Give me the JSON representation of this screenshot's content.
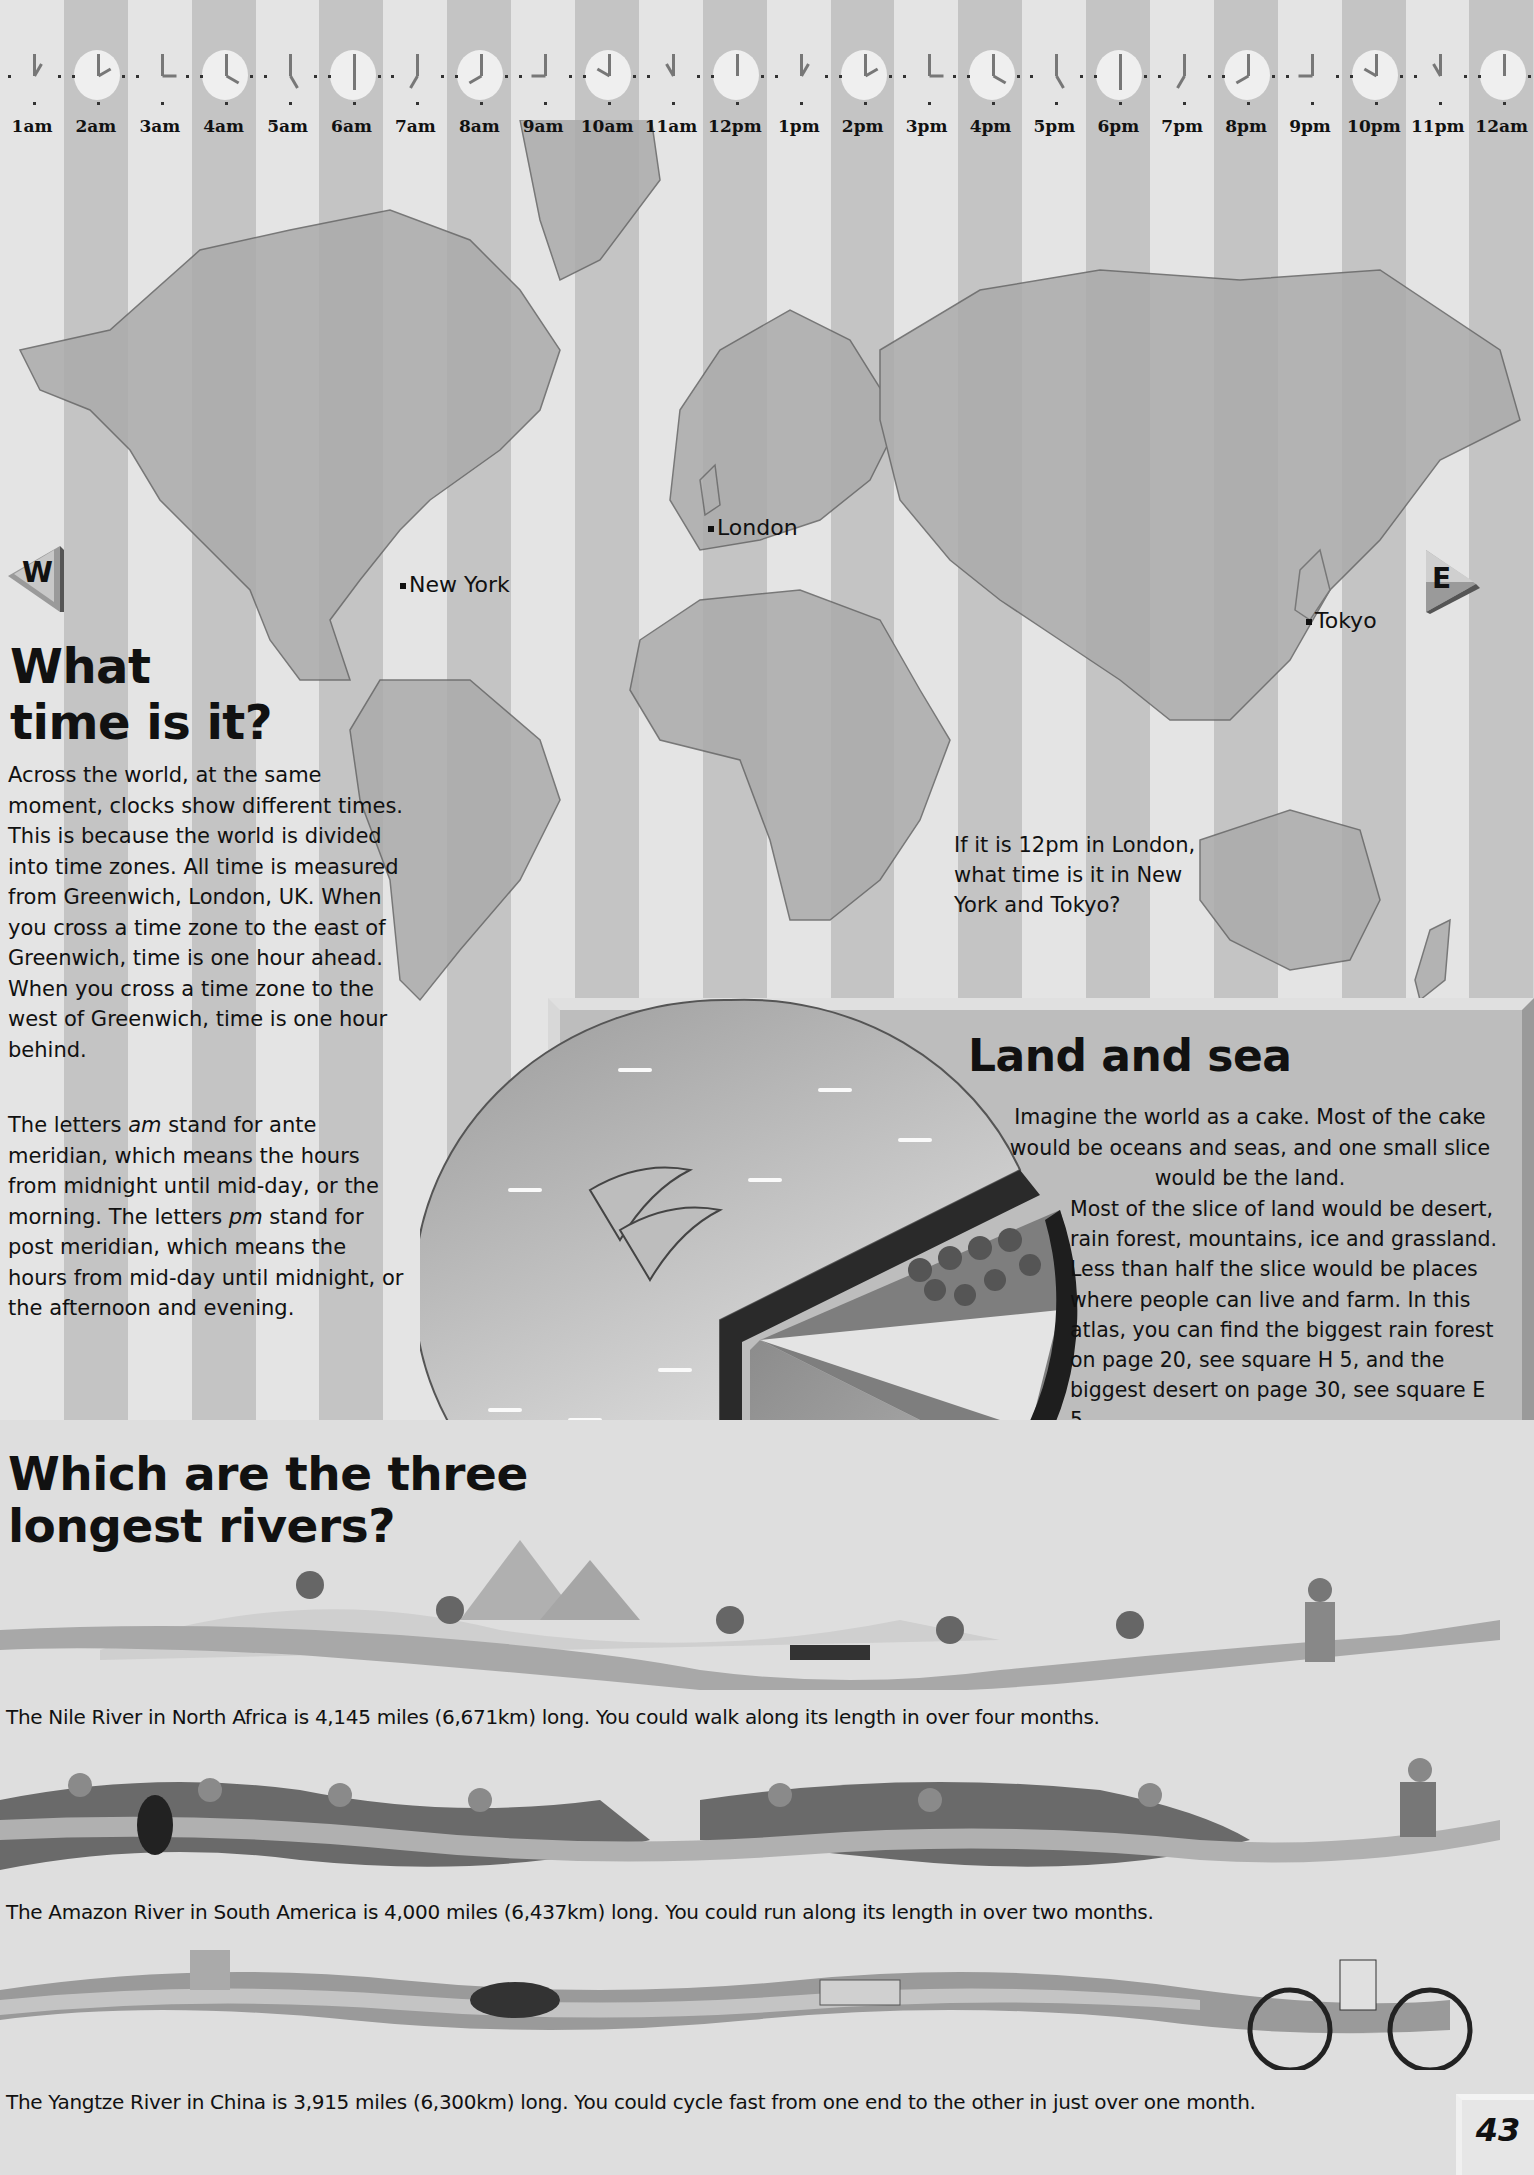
{
  "clocks": {
    "labels": [
      "1am",
      "2am",
      "3am",
      "4am",
      "5am",
      "6am",
      "7am",
      "8am",
      "9am",
      "10am",
      "11am",
      "12pm",
      "1pm",
      "2pm",
      "3pm",
      "4pm",
      "5pm",
      "6pm",
      "7pm",
      "8pm",
      "9pm",
      "10pm",
      "11pm",
      "12am"
    ]
  },
  "map": {
    "cities": {
      "london": "London",
      "new_york": "New York",
      "tokyo": "Tokyo"
    },
    "compass_west": "W",
    "compass_east": "E",
    "question": "If it is 12pm in London, what time is it in New York and Tokyo?"
  },
  "time_section": {
    "title_line1": "What",
    "title_line2": "time is it?",
    "paragraph1": "Across the world, at the same moment, clocks show different times. This is because the world is divided into time zones. All time is measured from Greenwich, London, UK. When you cross a time zone to the east of Greenwich, time is one hour ahead. When you cross a time zone to the west of Greenwich, time is one hour behind.",
    "paragraph2": {
      "p1": "The letters ",
      "am": "am",
      "p2": " stand for ante meridian, which means the hours from midnight until mid-day, or the morning. The letters ",
      "pm": "pm",
      "p3": " stand for post meridian, which means the hours from mid-day until midnight, or the afternoon and evening."
    }
  },
  "land_sea": {
    "title": "Land and sea",
    "text_intro": "Imagine the world as a cake. Most of the cake would be oceans and seas, and one small slice would be the land.",
    "text_detail": "Most of the slice of land would be desert, rain forest, mountains, ice and grassland. Less than half the slice would be places where people can live and farm. In this atlas, you can find the biggest rain forest on page 20, see square H 5, and the biggest desert on page 30, see square E 5."
  },
  "rivers": {
    "title_line1": "Which are the three",
    "title_line2": "longest rivers?",
    "items": [
      {
        "name": "Nile",
        "caption": "The Nile River in North Africa is 4,145 miles (6,671km) long. You could walk along its length in over four months."
      },
      {
        "name": "Amazon",
        "caption": "The Amazon River in South America is 4,000 miles (6,437km) long. You could run along its length in over two months."
      },
      {
        "name": "Yangtze",
        "caption": "The Yangtze River in China is 3,915 miles (6,300km) long. You could cycle fast from one end to the other in just over one month."
      }
    ]
  },
  "page_number": "43"
}
